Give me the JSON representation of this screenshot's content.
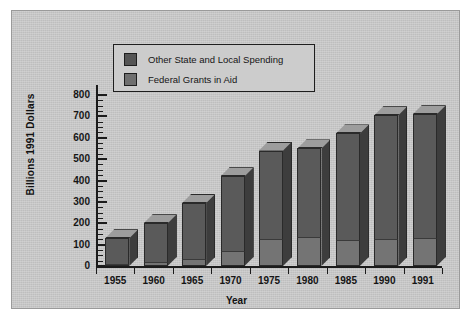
{
  "chart_data": {
    "type": "bar",
    "stacked": true,
    "title": "",
    "xlabel": "Year",
    "ylabel": "Billions 1991 Dollars",
    "categories": [
      "1955",
      "1960",
      "1965",
      "1970",
      "1975",
      "1980",
      "1985",
      "1990",
      "1991"
    ],
    "series": [
      {
        "name": "Federal Grants in Aid",
        "color": "#747474",
        "values": [
          10,
          20,
          35,
          70,
          125,
          135,
          120,
          125,
          130
        ]
      },
      {
        "name": "Other State and Local Spending",
        "color": "#5a5a5a",
        "values": [
          120,
          180,
          260,
          350,
          415,
          415,
          500,
          580,
          580
        ]
      }
    ],
    "totals": [
      130,
      200,
      295,
      420,
      540,
      550,
      620,
      705,
      710
    ],
    "ylim": [
      0,
      800
    ],
    "yticks": [
      0,
      100,
      200,
      300,
      400,
      500,
      600,
      700,
      800
    ],
    "ytick_labels": [
      "0",
      "100",
      "200",
      "300",
      "400",
      "500",
      "600",
      "700",
      "800"
    ],
    "minor_tick_interval": 25,
    "grid": false,
    "legend_position": "top-left-inside"
  },
  "legend": {
    "items": [
      {
        "label": "Other State and Local Spending",
        "swatch": "#555555"
      },
      {
        "label": "Federal Grants in Aid",
        "swatch": "#6f6f6f"
      }
    ]
  },
  "axes": {
    "x_title": "Year",
    "y_title": "Billions 1991 Dollars"
  },
  "colors": {
    "background": "#c9c9c9",
    "page": "#ffffff",
    "axis": "#1b1b1b",
    "bar_other": "#5a5a5a",
    "bar_federal": "#747474",
    "bar_top": "#9d9d9d",
    "bar_side": "#3d3d3d"
  }
}
